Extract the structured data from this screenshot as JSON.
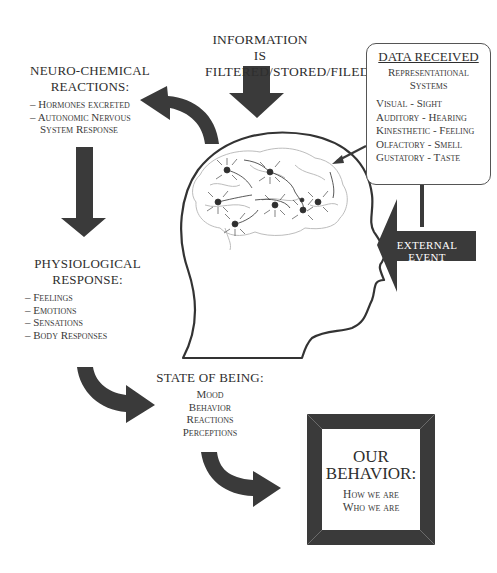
{
  "information": {
    "line1": "INFORMATION IS",
    "line2": "FILTERED/STORED/FILED"
  },
  "neuro_chemical": {
    "title_line1": "NEURO-CHEMICAL",
    "title_line2": "REACTIONS:",
    "items": [
      "Hormones excreted",
      "Autonomic Nervous",
      "System Response"
    ]
  },
  "data_received": {
    "title": "DATA RECEIVED",
    "subtitle_line1": "Representational",
    "subtitle_line2": "Systems",
    "items": [
      "Visual - Sight",
      "Auditory - Hearing",
      "Kinesthetic - Feeling",
      "Olfactory - Smell",
      "Gustatory - Taste"
    ]
  },
  "external_event": {
    "label": "EXTERNAL EVENT"
  },
  "physiological": {
    "title_line1": "PHYSIOLOGICAL",
    "title_line2": "RESPONSE:",
    "items": [
      "Feelings",
      "Emotions",
      "Sensations",
      "Body Responses"
    ]
  },
  "state_of_being": {
    "title": "STATE OF BEING:",
    "items": [
      "Mood",
      "Behavior",
      "Reactions",
      "Perceptions"
    ]
  },
  "our_behavior": {
    "title_line1": "OUR",
    "title_line2": "BEHAVIOR:",
    "line1": "How we are",
    "line2": "Who we are"
  },
  "colors": {
    "arrow": "#3a3a3a",
    "outline": "#333333",
    "brain": "#b8b8b8",
    "background": "#ffffff"
  },
  "icons": {
    "head": "human-head-profile",
    "brain": "brain-with-neurons"
  }
}
